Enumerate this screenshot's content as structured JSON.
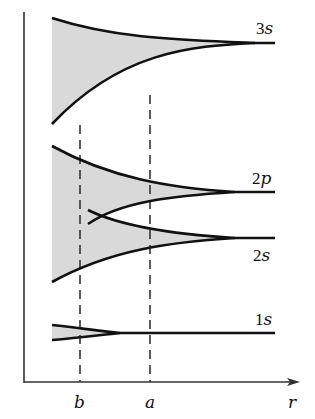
{
  "figure": {
    "axis": {
      "x_label": "r",
      "x_ticks": [
        {
          "label": "b",
          "x": 80
        },
        {
          "label": "a",
          "x": 150
        }
      ]
    },
    "bands": [
      {
        "id": "3s",
        "num": "3",
        "letter": "s"
      },
      {
        "id": "2p",
        "num": "2",
        "letter": "p"
      },
      {
        "id": "2s",
        "num": "2",
        "letter": "s"
      },
      {
        "id": "1s",
        "num": "1",
        "letter": "s"
      }
    ],
    "colors": {
      "band_fill": "#d9d9d9",
      "curve": "#111111",
      "axis": "#333333",
      "dash": "#333333"
    }
  }
}
